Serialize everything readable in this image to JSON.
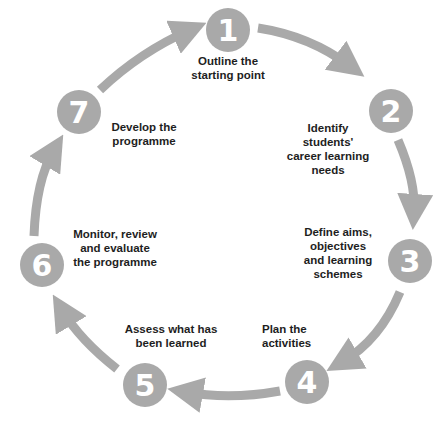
{
  "diagram": {
    "type": "cycle",
    "accent_color": "#a9a9a9",
    "text_color": "#1e1e1e",
    "steps": [
      {
        "number": "1",
        "label": "Outline the\nstarting point"
      },
      {
        "number": "2",
        "label": "Identify\nstudents'\ncareer learning\nneeds"
      },
      {
        "number": "3",
        "label": "Define aims,\nobjectives\nand learning\nschemes"
      },
      {
        "number": "4",
        "label": "Plan the\nactivities"
      },
      {
        "number": "5",
        "label": "Assess what has\nbeen learned"
      },
      {
        "number": "6",
        "label": "Monitor, review\nand evaluate\nthe programme"
      },
      {
        "number": "7",
        "label": "Develop the\nprogramme"
      }
    ]
  }
}
